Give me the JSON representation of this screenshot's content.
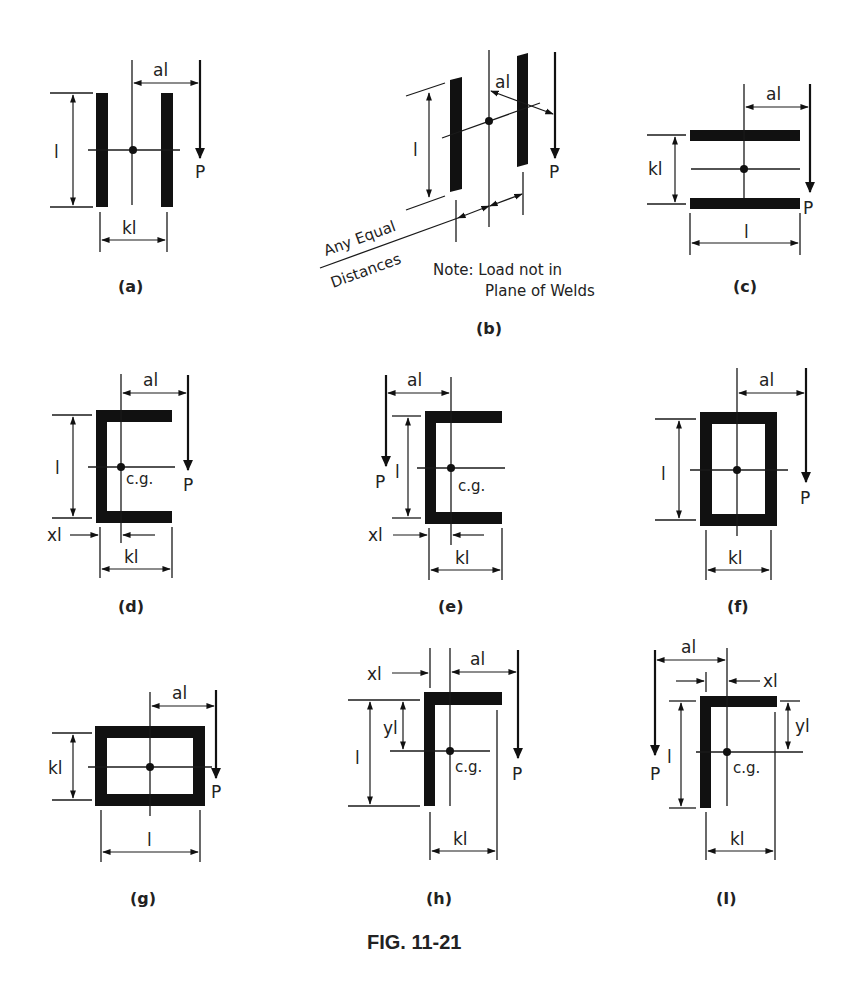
{
  "figure": {
    "title": "FIG. 11-21",
    "ink_color": "#111111",
    "background": "#ffffff"
  },
  "labels": {
    "length": "l",
    "load": "P",
    "eccentricity": "al",
    "width": "kl",
    "cg_offset_x": "xl",
    "cg_offset_y": "yl",
    "centroid": "c.g."
  },
  "panels": [
    {
      "id": "a",
      "caption": "(a)",
      "shape": "two parallel vertical welds",
      "dims": [
        "l",
        "kl",
        "al"
      ]
    },
    {
      "id": "b",
      "caption": "(b)",
      "shape": "two parallel welds, load out of plane",
      "dims": [
        "l",
        "al"
      ],
      "annotation_lines": [
        "Any Equal",
        "Distances"
      ],
      "note_lines": [
        "Note: Load not in",
        "Plane of Welds"
      ]
    },
    {
      "id": "c",
      "caption": "(c)",
      "shape": "two parallel horizontal welds",
      "dims": [
        "kl",
        "l",
        "al"
      ]
    },
    {
      "id": "d",
      "caption": "(d)",
      "shape": "channel weld opening right, load right",
      "dims": [
        "l",
        "xl",
        "kl",
        "al"
      ]
    },
    {
      "id": "e",
      "caption": "(e)",
      "shape": "channel weld opening right, load left",
      "dims": [
        "l",
        "xl",
        "kl",
        "al"
      ]
    },
    {
      "id": "f",
      "caption": "(f)",
      "shape": "box weld tall",
      "dims": [
        "l",
        "kl",
        "al"
      ]
    },
    {
      "id": "g",
      "caption": "(g)",
      "shape": "box weld wide",
      "dims": [
        "kl",
        "l",
        "al"
      ]
    },
    {
      "id": "h",
      "caption": "(h)",
      "shape": "angle weld, load right",
      "dims": [
        "xl",
        "yl",
        "l",
        "kl",
        "al"
      ]
    },
    {
      "id": "i",
      "caption": "(I)",
      "shape": "angle weld, load left",
      "dims": [
        "xl",
        "yl",
        "l",
        "kl",
        "al"
      ]
    }
  ]
}
